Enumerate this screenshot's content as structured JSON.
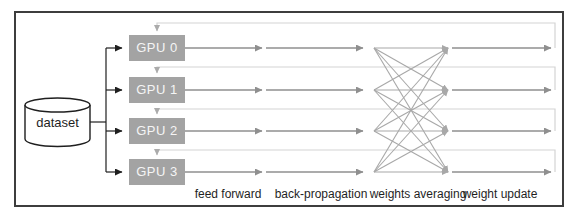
{
  "figure": {
    "dataset": {
      "label": "dataset"
    },
    "gpus": [
      {
        "label": "GPU 0"
      },
      {
        "label": "GPU 1"
      },
      {
        "label": "GPU 2"
      },
      {
        "label": "GPU 3"
      }
    ],
    "stages": [
      {
        "label": "feed forward"
      },
      {
        "label": "back-propagation"
      },
      {
        "label": "weights averaging"
      },
      {
        "label": "weight update"
      }
    ],
    "colors": {
      "gpu_box_fill": "#a3a3a3",
      "gpu_box_text": "#f5f5f5",
      "flow_arrow": "#8f8f8f",
      "crossing_line": "#a8a8a8",
      "feedback_line": "#d4d4d4",
      "dataset_stroke": "#1f1f1f",
      "frame_border": "#3d3d3d",
      "label_text": "#1f1f1f"
    }
  }
}
